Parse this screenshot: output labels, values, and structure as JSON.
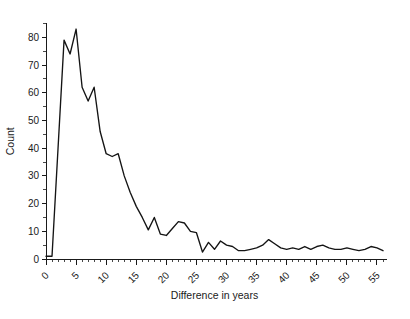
{
  "figure": {
    "background_color": "#ffffff",
    "line_color": "#141414",
    "axis_color": "#1a1a1a"
  },
  "axes": {
    "ylabel": "Count",
    "xlabel": "Difference in years",
    "y_ticks": [
      "0",
      "10",
      "20",
      "30",
      "40",
      "50",
      "60",
      "70",
      "80"
    ],
    "x_ticks": [
      "0",
      "5",
      "10",
      "15",
      "20",
      "25",
      "30",
      "35",
      "40",
      "45",
      "50",
      "55"
    ]
  },
  "chart_data": {
    "type": "line",
    "title": "",
    "xlabel": "Difference in years",
    "ylabel": "Count",
    "xlim": [
      0,
      56
    ],
    "ylim": [
      0,
      85
    ],
    "grid": false,
    "legend": null,
    "y_tick_values": [
      0,
      10,
      20,
      30,
      40,
      50,
      60,
      70,
      80
    ],
    "x_tick_values": [
      0,
      5,
      10,
      15,
      20,
      25,
      30,
      35,
      40,
      45,
      50,
      55
    ],
    "y_minor_tick_step": 5,
    "x_minor_tick_step": 1,
    "x": [
      0,
      1,
      2,
      3,
      4,
      5,
      6,
      7,
      8,
      9,
      10,
      11,
      12,
      13,
      14,
      15,
      16,
      17,
      18,
      19,
      20,
      21,
      22,
      23,
      24,
      25,
      26,
      27,
      28,
      29,
      30,
      31,
      32,
      33,
      34,
      35,
      36,
      37,
      38,
      39,
      40,
      41,
      42,
      43,
      44,
      45,
      46,
      47,
      48,
      49,
      50,
      51,
      52,
      53,
      54,
      55,
      56
    ],
    "y": [
      1,
      1,
      40,
      79,
      74,
      83,
      62,
      57,
      62,
      46,
      38,
      37,
      38,
      30,
      24,
      19,
      15,
      10.5,
      15,
      9,
      8.5,
      11,
      13.5,
      13,
      10,
      9.5,
      2.5,
      6,
      3.5,
      6.5,
      5,
      4.5,
      3,
      3,
      3.5,
      4,
      5,
      7,
      5.5,
      4,
      3.5,
      4,
      3.5,
      4.5,
      3.5,
      4.5,
      5,
      4,
      3.5,
      3.5,
      4,
      3.5,
      3,
      3.5,
      4.5,
      4,
      3
    ]
  }
}
